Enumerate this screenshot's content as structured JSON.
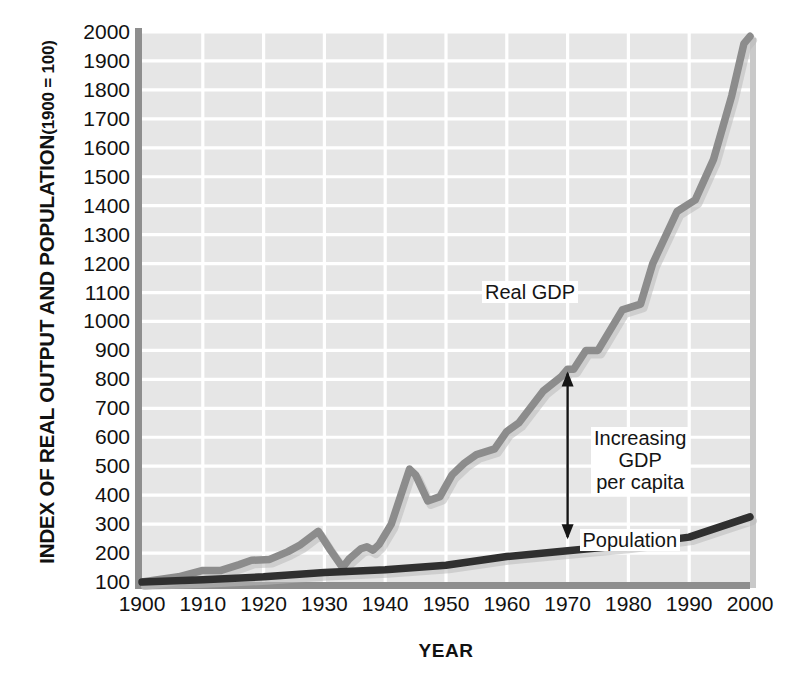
{
  "chart_data": {
    "type": "line",
    "title": "",
    "subtitle": "",
    "ylabel_main": "INDEX OF REAL OUTPUT AND POPULATION",
    "ylabel_sub": "(1900 = 100)",
    "xlabel": "YEAR",
    "xlim": [
      1900,
      2000
    ],
    "ylim": [
      100,
      2000
    ],
    "xticks": [
      1900,
      1910,
      1920,
      1930,
      1940,
      1950,
      1960,
      1970,
      1980,
      1990,
      2000
    ],
    "yticks": [
      100,
      200,
      300,
      400,
      500,
      600,
      700,
      800,
      900,
      1000,
      1100,
      1200,
      1300,
      1400,
      1500,
      1600,
      1700,
      1800,
      1900,
      2000
    ],
    "grid": true,
    "legend_position": "inline-labels",
    "plot_background": "#e6e6e6",
    "gridline_color": "#ffffff",
    "series": [
      {
        "name": "Real GDP",
        "color": "#8c8c8c",
        "label_text": "Real GDP",
        "x": [
          1900,
          1906,
          1910,
          1913,
          1916,
          1918,
          1921,
          1924,
          1926,
          1929,
          1931,
          1933,
          1934,
          1936,
          1937,
          1938,
          1939,
          1941,
          1944,
          1945,
          1947,
          1949,
          1951,
          1953,
          1955,
          1958,
          1960,
          1962,
          1966,
          1969,
          1970,
          1971,
          1973,
          1975,
          1979,
          1982,
          1984,
          1988,
          1991,
          1994,
          1997,
          1999,
          2000
        ],
        "values": [
          100,
          118,
          140,
          140,
          160,
          175,
          178,
          205,
          228,
          275,
          210,
          150,
          178,
          215,
          222,
          210,
          230,
          300,
          490,
          470,
          380,
          395,
          470,
          510,
          540,
          560,
          620,
          650,
          760,
          810,
          835,
          835,
          900,
          900,
          1040,
          1060,
          1200,
          1380,
          1420,
          1560,
          1780,
          1960,
          1985
        ]
      },
      {
        "name": "Population",
        "color": "#303030",
        "label_text": "Population",
        "x": [
          1900,
          1910,
          1920,
          1930,
          1940,
          1950,
          1960,
          1970,
          1980,
          1990,
          2000
        ],
        "values": [
          100,
          108,
          118,
          133,
          142,
          158,
          188,
          208,
          228,
          255,
          325
        ]
      }
    ],
    "annotations": [
      {
        "name": "increasing-gdp-per-capita",
        "text_lines": [
          "Increasing",
          "GDP",
          "per capita"
        ],
        "arrow_x_year": 1970,
        "arrow_y_top": 820,
        "arrow_y_bottom": 255,
        "arrow_style": "double-headed",
        "arrow_color": "#151515"
      }
    ]
  },
  "labels": {
    "real_gdp": "Real GDP",
    "population": "Population",
    "increasing": "Increasing",
    "gdp": "GDP",
    "per_capita": "per capita"
  }
}
